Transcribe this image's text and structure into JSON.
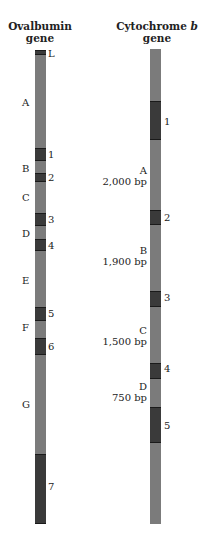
{
  "genes": [
    {
      "id": "ovalbumin",
      "title_line1": "Ovalbumin",
      "title_line2": "gene",
      "bar": {
        "x": 35,
        "width": 11,
        "top": 50,
        "bottom": 524
      },
      "exons": [
        {
          "label": "L",
          "top": 50,
          "bottom": 55,
          "label_y": 48
        },
        {
          "label": "1",
          "top": 148,
          "bottom": 161,
          "label_y": 149
        },
        {
          "label": "2",
          "top": 173,
          "bottom": 182,
          "label_y": 172
        },
        {
          "label": "3",
          "top": 213,
          "bottom": 226,
          "label_y": 214
        },
        {
          "label": "4",
          "top": 239,
          "bottom": 251,
          "label_y": 240
        },
        {
          "label": "5",
          "top": 307,
          "bottom": 321,
          "label_y": 308
        },
        {
          "label": "6",
          "top": 338,
          "bottom": 355,
          "label_y": 341
        },
        {
          "label": "7",
          "top": 454,
          "bottom": 524,
          "label_y": 481
        }
      ],
      "introns": [
        {
          "label": "A",
          "label_y": 97
        },
        {
          "label": "B",
          "label_y": 163
        },
        {
          "label": "C",
          "label_y": 192
        },
        {
          "label": "D",
          "label_y": 228
        },
        {
          "label": "E",
          "label_y": 275
        },
        {
          "label": "F",
          "label_y": 322
        },
        {
          "label": "G",
          "label_y": 399
        }
      ]
    },
    {
      "id": "cytochrome-b",
      "title_line1": "Cytochrome",
      "title_italic": "b",
      "title_line2": "gene",
      "bar": {
        "x": 150,
        "width": 11,
        "top": 49,
        "bottom": 524
      },
      "exons": [
        {
          "label": "1",
          "top": 101,
          "bottom": 140,
          "label_y": 116
        },
        {
          "label": "2",
          "top": 210,
          "bottom": 225,
          "label_y": 212
        },
        {
          "label": "3",
          "top": 291,
          "bottom": 307,
          "label_y": 292
        },
        {
          "label": "4",
          "top": 363,
          "bottom": 379,
          "label_y": 363
        },
        {
          "label": "5",
          "top": 407,
          "bottom": 443,
          "label_y": 420
        }
      ],
      "introns": [
        {
          "label": "A",
          "size": "2,000 bp",
          "label_y": 165
        },
        {
          "label": "B",
          "size": "1,900 bp",
          "label_y": 245
        },
        {
          "label": "C",
          "size": "1,500 bp",
          "label_y": 325
        },
        {
          "label": "D",
          "size": "750 bp",
          "label_y": 381
        }
      ]
    }
  ],
  "colors": {
    "intron": "#7b7b7b",
    "exon": "#3a3a3a",
    "text": "#222222"
  }
}
